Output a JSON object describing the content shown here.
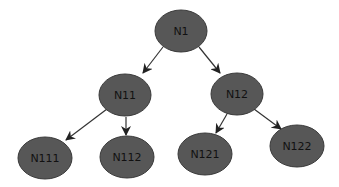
{
  "diagram": {
    "type": "tree",
    "colors": {
      "background": "#ffffff",
      "node_fill": "#575757",
      "node_stroke": "#3a3a3a",
      "label": "#111111",
      "edge": "#333333"
    },
    "nodes": [
      {
        "id": "N1",
        "label": "N1",
        "cx": 181,
        "cy": 31,
        "rx": 26,
        "ry": 21
      },
      {
        "id": "N11",
        "label": "N11",
        "cx": 125,
        "cy": 95,
        "rx": 26,
        "ry": 21
      },
      {
        "id": "N12",
        "label": "N12",
        "cx": 237,
        "cy": 94,
        "rx": 26,
        "ry": 21
      },
      {
        "id": "N111",
        "label": "N111",
        "cx": 45,
        "cy": 158,
        "rx": 27,
        "ry": 21
      },
      {
        "id": "N112",
        "label": "N112",
        "cx": 127,
        "cy": 157,
        "rx": 27,
        "ry": 21
      },
      {
        "id": "N121",
        "label": "N121",
        "cx": 205,
        "cy": 154,
        "rx": 27,
        "ry": 21
      },
      {
        "id": "N122",
        "label": "N122",
        "cx": 297,
        "cy": 146,
        "rx": 27,
        "ry": 21
      }
    ],
    "edges": [
      {
        "from": "N1",
        "to": "N11",
        "x1": 163,
        "y1": 47,
        "x2": 143,
        "y2": 73
      },
      {
        "from": "N1",
        "to": "N12",
        "x1": 199,
        "y1": 47,
        "x2": 220,
        "y2": 73
      },
      {
        "from": "N11",
        "to": "N111",
        "x1": 107,
        "y1": 109,
        "x2": 66,
        "y2": 140
      },
      {
        "from": "N11",
        "to": "N112",
        "x1": 126,
        "y1": 117,
        "x2": 126,
        "y2": 135
      },
      {
        "from": "N12",
        "to": "N121",
        "x1": 227,
        "y1": 114,
        "x2": 216,
        "y2": 133
      },
      {
        "from": "N12",
        "to": "N122",
        "x1": 254,
        "y1": 109,
        "x2": 281,
        "y2": 129
      }
    ]
  }
}
